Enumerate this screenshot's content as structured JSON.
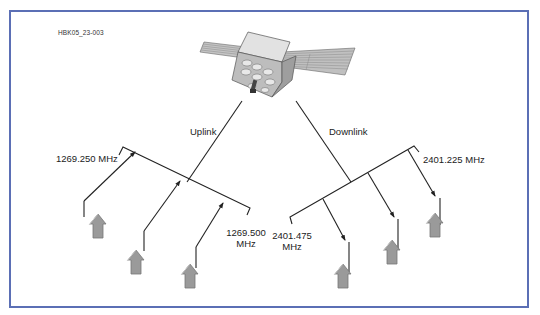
{
  "figure": {
    "id_label": "HBK05_23-003",
    "border_color": "#5b6fb5"
  },
  "satellite": {
    "icon": "satellite-icon"
  },
  "links": {
    "uplink": {
      "label": "Uplink",
      "freq_low": "1269.250 MHz",
      "freq_high_line1": "1269.500",
      "freq_high_line2": "MHz",
      "ground_stations": 3
    },
    "downlink": {
      "label": "Downlink",
      "freq_high": "2401.225 MHz",
      "freq_low_line1": "2401.475",
      "freq_low_line2": "MHz",
      "ground_stations": 3
    }
  },
  "colors": {
    "line": "#222222",
    "station_fill": "#9a9a9a",
    "station_stroke": "#6a6a6a",
    "panel_fill": "#b8b8b8",
    "body_fill": "#d4d4d4"
  }
}
